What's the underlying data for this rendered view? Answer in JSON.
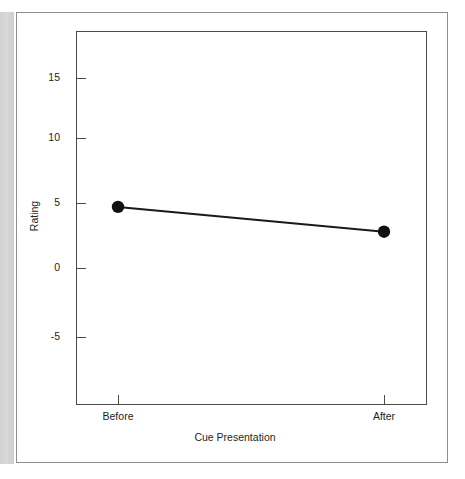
{
  "figure": {
    "has_outer_frame": true,
    "gutter_shade": "#d4d4d4"
  },
  "chart_data": {
    "type": "line",
    "title": "",
    "subtitle": "",
    "xlabel": "Cue Presentation",
    "ylabel": "Rating",
    "categories": [
      "Before",
      "After"
    ],
    "values": [
      4.7,
      2.8
    ],
    "series": [
      {
        "name": "Rating",
        "values": [
          4.7,
          2.8
        ]
      }
    ],
    "x_tick_labels": [
      "Before",
      "After"
    ],
    "y_tick_labels": [
      "15",
      "10",
      "5",
      "0",
      "-5"
    ],
    "y_ticks": [
      15,
      10,
      5,
      0,
      -5
    ],
    "ylim": [
      -10.5,
      18.2
    ],
    "xlim": [
      0,
      1
    ],
    "grid": false,
    "legend": "none",
    "marker": "filled-circle",
    "marker_color": "#111111",
    "line_color": "#1a1a1a",
    "axis_color": "#4a4a4a",
    "tick_direction": "in",
    "annotations": []
  }
}
